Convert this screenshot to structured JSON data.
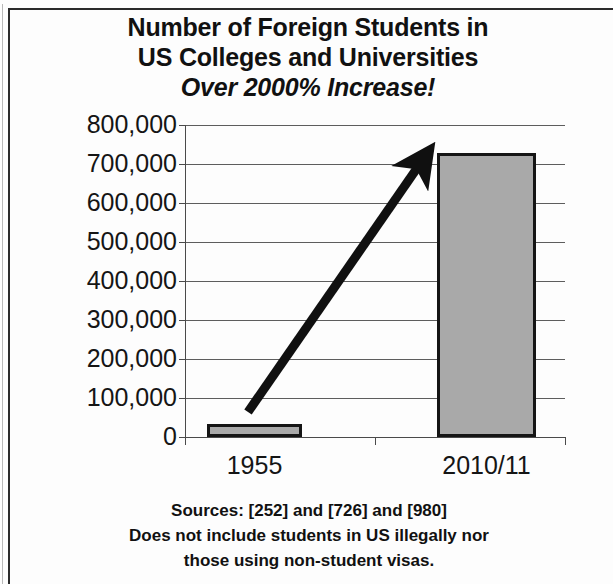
{
  "frame": {
    "border_color": "#2b2b2b",
    "background": "#fdfdfd"
  },
  "title": {
    "line1": "Number of Foreign Students in",
    "line2": "US Colleges and Universities",
    "line3": "Over 2000% Increase!"
  },
  "footer": {
    "line1": "Sources: [252] and [726] and [980]",
    "line2": "Does not include students in US illegally nor",
    "line3": "those using non-student visas."
  },
  "annotation": {
    "growth_arrow": "upward-growth-arrow"
  },
  "chart_data": {
    "type": "bar",
    "title": "Number of Foreign Students in US Colleges and Universities Over 2000% Increase!",
    "xlabel": "",
    "ylabel": "",
    "categories": [
      "1955",
      "2010/11"
    ],
    "values": [
      34000,
      728000
    ],
    "ylim": [
      0,
      800000
    ],
    "ytick_values": [
      0,
      100000,
      200000,
      300000,
      400000,
      500000,
      600000,
      700000,
      800000
    ],
    "ytick_labels": [
      "0",
      "100,000",
      "200,000",
      "300,000",
      "400,000",
      "500,000",
      "600,000",
      "700,000",
      "800,000"
    ],
    "grid": true,
    "legend": null,
    "bar_fill_color": "#a9a9a9",
    "bar_edge_color": "#151515",
    "annotations": [
      {
        "type": "arrow",
        "label": "growth arrow from 1955 bar to 2010/11 bar",
        "from": {
          "x": "1955",
          "y": 35000
        },
        "to": {
          "x": "2010/11",
          "y": 720000
        }
      }
    ]
  }
}
